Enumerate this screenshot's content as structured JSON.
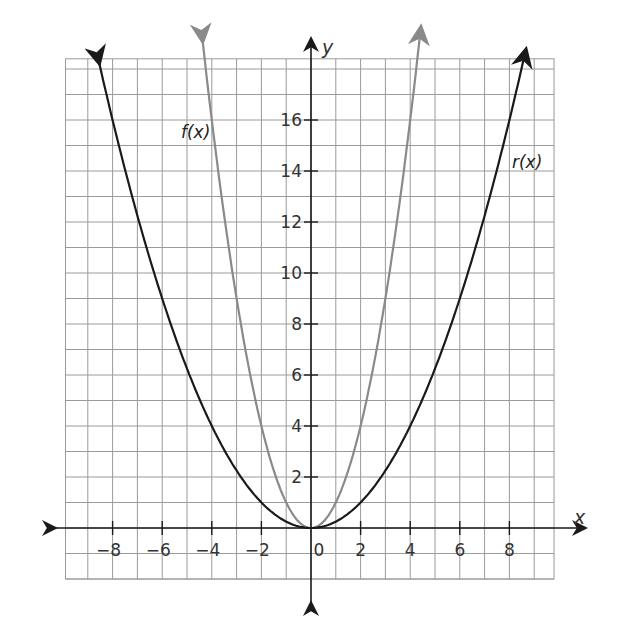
{
  "chart_data": {
    "type": "line",
    "title": "",
    "xlabel": "x",
    "ylabel": "y",
    "xlim": [
      -10,
      10
    ],
    "ylim": [
      -2,
      18
    ],
    "grid": true,
    "x_ticks": [
      "−8",
      "−6",
      "−4",
      "−2",
      "0",
      "2",
      "4",
      "6",
      "8"
    ],
    "y_ticks": [
      "2",
      "4",
      "6",
      "8",
      "10",
      "12",
      "14",
      "16"
    ],
    "series": [
      {
        "name": "f(x)",
        "label": "f(x)",
        "equation": "x^2",
        "color": "#8a8a8a",
        "x": [
          -4.4,
          -4,
          -3,
          -2,
          -1,
          0,
          1,
          2,
          3,
          4,
          4.4
        ],
        "values": [
          19.4,
          16,
          9,
          4,
          1,
          0,
          1,
          4,
          9,
          16,
          19.4
        ]
      },
      {
        "name": "r(x)",
        "label": "r(x)",
        "equation": "x^2/4",
        "color": "#1a1a1a",
        "x": [
          -8.6,
          -8,
          -6,
          -4,
          -2,
          0,
          2,
          4,
          6,
          8,
          8.6
        ],
        "values": [
          18.5,
          16,
          9,
          4,
          1,
          0,
          1,
          4,
          9,
          16,
          18.5
        ]
      }
    ]
  },
  "labels": {
    "x_axis": "x",
    "y_axis": "y",
    "f_label": "f(x)",
    "r_label": "r(x)"
  }
}
